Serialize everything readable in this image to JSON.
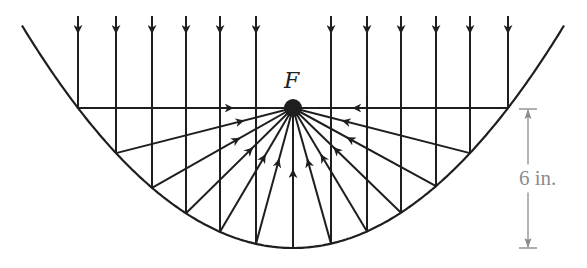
{
  "diagram": {
    "type": "parabolic-reflector",
    "focus_label": "F",
    "dimension_label": "6 in.",
    "colors": {
      "ink": "#1e1e1e",
      "dimension": "#8c8c8c",
      "background": "#ffffff"
    },
    "geometry": {
      "vertex": [
        293,
        248
      ],
      "focus": [
        293,
        108
      ],
      "curvature_k": 0.003029,
      "parabola_x_range": [
        22,
        564
      ],
      "incoming_ray_top_y": 16,
      "incoming_ray_x": [
        78,
        116,
        152,
        186,
        220,
        256,
        331,
        367,
        401,
        436,
        470,
        508
      ],
      "center_ray_x": 293,
      "dimension": {
        "x": 528,
        "top_y": 109,
        "bottom_y": 248,
        "tick_half_width": 9
      }
    }
  }
}
